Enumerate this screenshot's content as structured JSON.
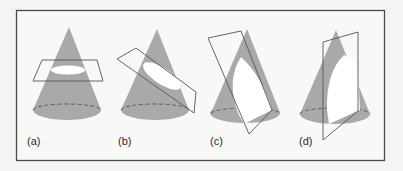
{
  "figure": {
    "type": "conic-sections-diagram",
    "colors": {
      "background": "#f4f4f2",
      "frame": "#4a4a4a",
      "cone_fill": "#a9a9a9",
      "section_fill": "#ffffff",
      "plane_stroke": "#555555",
      "dashed_base": "#555555"
    },
    "panels": [
      {
        "id": "a",
        "label": "(a)",
        "section": "circle"
      },
      {
        "id": "b",
        "label": "(b)",
        "section": "ellipse"
      },
      {
        "id": "c",
        "label": "(c)",
        "section": "parabola"
      },
      {
        "id": "d",
        "label": "(d)",
        "section": "hyperbola"
      }
    ]
  }
}
